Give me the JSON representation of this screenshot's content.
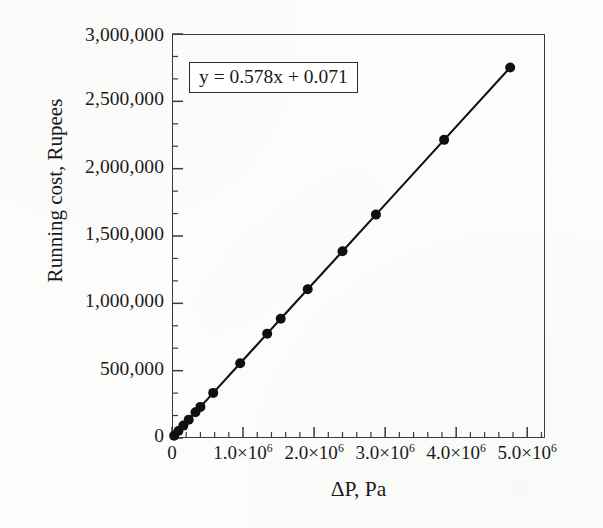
{
  "chart_data": {
    "type": "scatter",
    "title": "",
    "xlabel": "ΔP, Pa",
    "ylabel": "Running cost, Rupees",
    "annotation": "y = 0.578x + 0.071",
    "grid": false,
    "legend": null,
    "xlim": [
      0,
      5250000
    ],
    "ylim": [
      0,
      3000000
    ],
    "x_major_ticks": [
      0,
      1000000,
      2000000,
      3000000,
      4000000,
      5000000
    ],
    "x_tick_labels": [
      "0",
      "1.0×10⁶",
      "2.0×10⁶",
      "3.0×10⁶",
      "4.0×10⁶",
      "5.0×10⁶"
    ],
    "x_tick_mantissas": [
      "0",
      "1.0×10",
      "2.0×10",
      "3.0×10",
      "4.0×10",
      "5.0×10"
    ],
    "x_tick_exponents": [
      "",
      "6",
      "6",
      "6",
      "6",
      "6"
    ],
    "x_minor_per_major": 4,
    "y_major_ticks": [
      0,
      500000,
      1000000,
      1500000,
      2000000,
      2500000,
      3000000
    ],
    "y_tick_labels": [
      "0",
      "500,000",
      "1,000,000",
      "1,500,000",
      "2,000,000",
      "2,500,000",
      "3,000,000"
    ],
    "y_minor_per_major": 2,
    "series": [
      {
        "name": "Running cost",
        "marker": "filled-circle",
        "line": "solid",
        "color": "#101010",
        "points": [
          {
            "x": 30000,
            "y": 17000
          },
          {
            "x": 90000,
            "y": 52000
          },
          {
            "x": 160000,
            "y": 92000
          },
          {
            "x": 235000,
            "y": 136000
          },
          {
            "x": 330000,
            "y": 191000
          },
          {
            "x": 400000,
            "y": 231000
          },
          {
            "x": 580000,
            "y": 335000
          },
          {
            "x": 960000,
            "y": 555000
          },
          {
            "x": 1340000,
            "y": 775000
          },
          {
            "x": 1530000,
            "y": 885000
          },
          {
            "x": 1910000,
            "y": 1104000
          },
          {
            "x": 2400000,
            "y": 1387000
          },
          {
            "x": 2870000,
            "y": 1659000
          },
          {
            "x": 3830000,
            "y": 2214000
          },
          {
            "x": 4760000,
            "y": 2751000
          }
        ]
      }
    ],
    "fit": {
      "slope": 0.578,
      "intercept": 0.071,
      "units_note": "x in Pa, y scaled in millions"
    }
  },
  "axes": {
    "y_title": "Running cost, Rupees",
    "x_title": "ΔP, Pa"
  },
  "annotation": {
    "equation": "y = 0.578x + 0.071"
  },
  "style": {
    "frame_color": "#3a3a3a",
    "marker_color": "#101010",
    "line_color": "#101010",
    "background": "#fdfdfc"
  }
}
